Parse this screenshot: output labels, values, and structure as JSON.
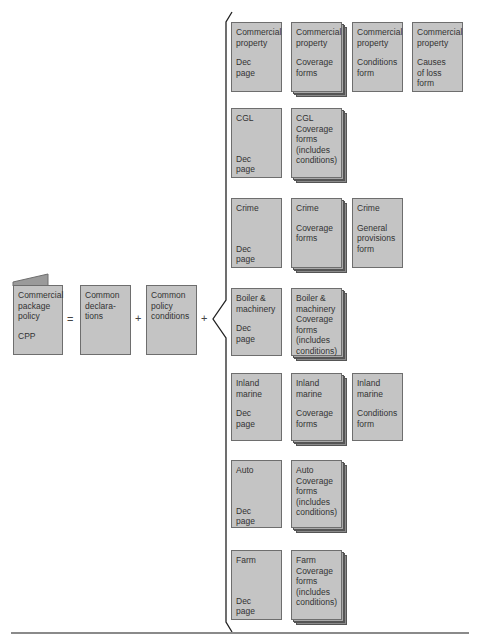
{
  "colors": {
    "box_fill": "#c4c4c4",
    "box_border": "#6e6e6e",
    "text": "#333333"
  },
  "left": {
    "cpp": {
      "title": "Commercial\npackage\npolicy",
      "abbr": "CPP"
    },
    "equals": "=",
    "common_declarations": "Common\ndeclara-\ntions",
    "plus1": "+",
    "common_conditions": "Common\npolicy\nconditions",
    "plus2": "+"
  },
  "rows": [
    {
      "name": "commercial-property",
      "dec": {
        "title": "Commercial\nproperty",
        "sub": "Dec\npage"
      },
      "forms": [
        {
          "title": "Commercial\nproperty",
          "sub": "Coverage\nforms",
          "stacked": true
        },
        {
          "title": "Commercial\nproperty",
          "sub": "Conditions\nform",
          "stacked": false
        },
        {
          "title": "Commercial\nproperty",
          "sub": "Causes\nof loss\nform",
          "stacked": false
        }
      ]
    },
    {
      "name": "cgl",
      "dec": {
        "title": "CGL",
        "sub": "Dec\npage"
      },
      "forms": [
        {
          "title": "CGL\nCoverage\nforms\n(includes\nconditions)",
          "sub": "",
          "stacked": true
        }
      ]
    },
    {
      "name": "crime",
      "dec": {
        "title": "Crime",
        "sub": "Dec\npage"
      },
      "forms": [
        {
          "title": "Crime",
          "sub": "Coverage\nforms",
          "stacked": true
        },
        {
          "title": "Crime",
          "sub": "General\nprovisions\nform",
          "stacked": false
        }
      ]
    },
    {
      "name": "boiler-machinery",
      "dec": {
        "title": "Boiler &\nmachinery",
        "sub": "Dec\npage"
      },
      "forms": [
        {
          "title": "Boiler &\nmachinery\nCoverage\nforms\n(includes\nconditions)",
          "sub": "",
          "stacked": true
        }
      ]
    },
    {
      "name": "inland-marine",
      "dec": {
        "title": "Inland\nmarine",
        "sub": "Dec\npage"
      },
      "forms": [
        {
          "title": "Inland\nmarine",
          "sub": "Coverage\nforms",
          "stacked": true
        },
        {
          "title": "Inland\nmarine",
          "sub": "Conditions\nform",
          "stacked": false
        }
      ]
    },
    {
      "name": "auto",
      "dec": {
        "title": "Auto",
        "sub": "Dec\npage"
      },
      "forms": [
        {
          "title": "Auto\nCoverage\nforms\n(includes\nconditions)",
          "sub": "",
          "stacked": true
        }
      ]
    },
    {
      "name": "farm",
      "dec": {
        "title": "Farm",
        "sub": "Dec\npage"
      },
      "forms": [
        {
          "title": "Farm\nCoverage\nforms\n(includes\nconditions)",
          "sub": "",
          "stacked": true
        }
      ]
    }
  ]
}
